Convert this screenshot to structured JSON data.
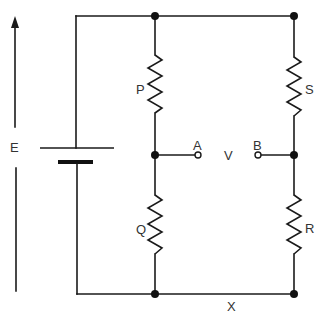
{
  "diagram": {
    "type": "circuit",
    "title": "",
    "labels": {
      "emf": "E",
      "resistor_p": "P",
      "resistor_q": "Q",
      "resistor_s": "S",
      "resistor_r": "R",
      "terminal_a": "A",
      "terminal_b": "B",
      "voltmeter": "V",
      "bottom_wire": "X"
    },
    "components": [
      {
        "id": "E",
        "kind": "battery",
        "position": "left branch"
      },
      {
        "id": "P",
        "kind": "resistor",
        "position": "top-left arm"
      },
      {
        "id": "Q",
        "kind": "resistor",
        "position": "bottom-left arm"
      },
      {
        "id": "S",
        "kind": "resistor",
        "position": "top-right arm"
      },
      {
        "id": "R",
        "kind": "resistor",
        "position": "bottom-right arm"
      },
      {
        "id": "A",
        "kind": "open terminal",
        "position": "between P and Q"
      },
      {
        "id": "B",
        "kind": "open terminal",
        "position": "between S and R"
      }
    ],
    "colors": {
      "line": "#1a1a1a",
      "text": "#333333",
      "background": "#ffffff"
    }
  }
}
